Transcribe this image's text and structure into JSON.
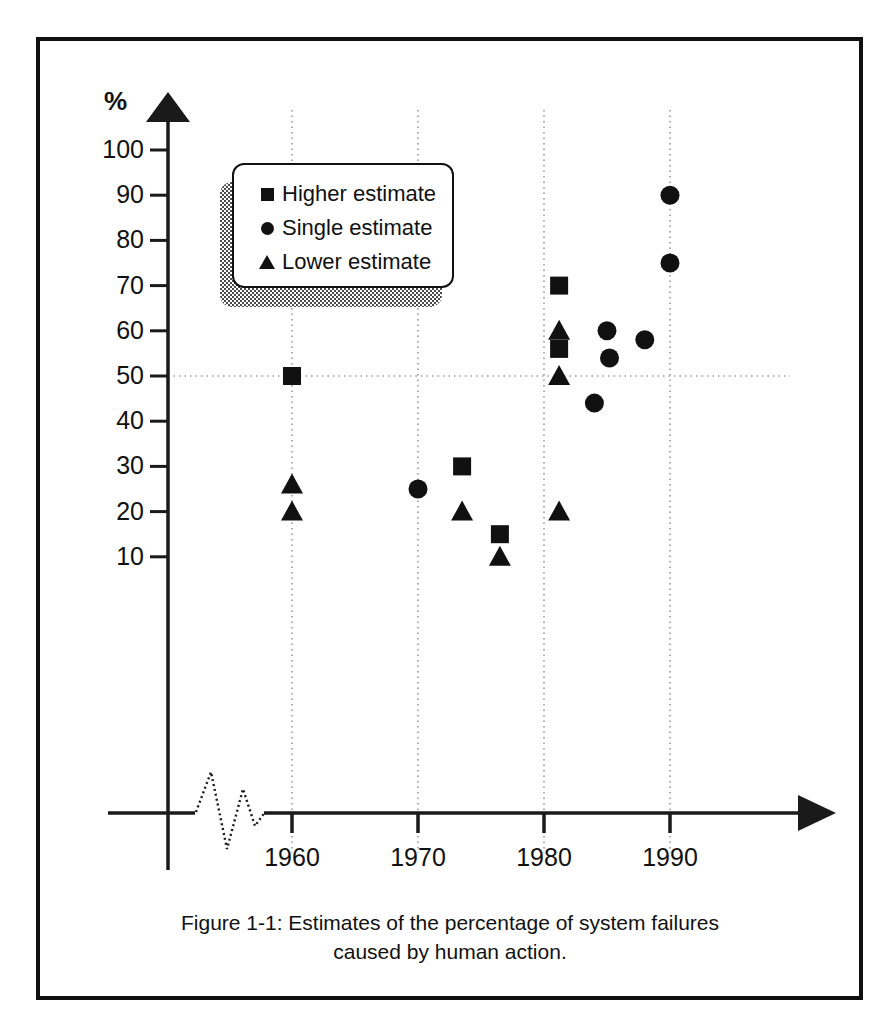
{
  "figure": {
    "caption_line1": "Figure 1-1: Estimates of the percentage of system failures",
    "caption_line2": "caused by human action.",
    "axis_unit_label": "%"
  },
  "legend": {
    "items": [
      {
        "marker": "square",
        "label": "Higher estimate"
      },
      {
        "marker": "circle",
        "label": "Single estimate"
      },
      {
        "marker": "triangle",
        "label": "Lower estimate"
      }
    ]
  },
  "chart_data": {
    "type": "scatter",
    "title": "Figure 1-1: Estimates of the percentage of system failures caused by human action.",
    "xlabel": "",
    "ylabel": "%",
    "xlim": [
      1958,
      1994
    ],
    "ylim": [
      0,
      105
    ],
    "x_ticks": [
      1960,
      1970,
      1980,
      1990
    ],
    "x_tick_labels": [
      "1960",
      "1970",
      "1980",
      "1990"
    ],
    "y_ticks": [
      10,
      20,
      30,
      40,
      50,
      60,
      70,
      80,
      90,
      100
    ],
    "y_tick_labels": [
      "10",
      "20",
      "30",
      "40",
      "50",
      "60",
      "70",
      "80",
      "90",
      "100"
    ],
    "grid": "vertical dotted at each x tick; horizontal dotted at y=50",
    "axis_break": "zigzag break on x-axis between origin and 1960",
    "legend_position": "upper left inside plot",
    "series": [
      {
        "name": "Higher estimate",
        "marker": "square",
        "points": [
          {
            "x": 1960,
            "y": 50
          },
          {
            "x": 1973.5,
            "y": 30
          },
          {
            "x": 1976.5,
            "y": 15
          },
          {
            "x": 1981.2,
            "y": 70
          },
          {
            "x": 1981.2,
            "y": 56
          }
        ]
      },
      {
        "name": "Single estimate",
        "marker": "circle",
        "points": [
          {
            "x": 1970,
            "y": 25
          },
          {
            "x": 1985,
            "y": 60
          },
          {
            "x": 1985.2,
            "y": 54
          },
          {
            "x": 1984,
            "y": 44
          },
          {
            "x": 1988,
            "y": 58
          },
          {
            "x": 1990,
            "y": 90
          },
          {
            "x": 1990,
            "y": 75
          }
        ]
      },
      {
        "name": "Lower estimate",
        "marker": "triangle",
        "points": [
          {
            "x": 1960,
            "y": 26
          },
          {
            "x": 1960,
            "y": 20
          },
          {
            "x": 1973.5,
            "y": 20
          },
          {
            "x": 1976.5,
            "y": 10
          },
          {
            "x": 1981.2,
            "y": 60
          },
          {
            "x": 1981.2,
            "y": 50
          },
          {
            "x": 1981.2,
            "y": 20
          }
        ]
      }
    ]
  },
  "colors": {
    "marker": "#111111",
    "axis": "#1a1a1a",
    "grid": "#9a9a9a",
    "frame": "#101010",
    "background": "#ffffff"
  }
}
